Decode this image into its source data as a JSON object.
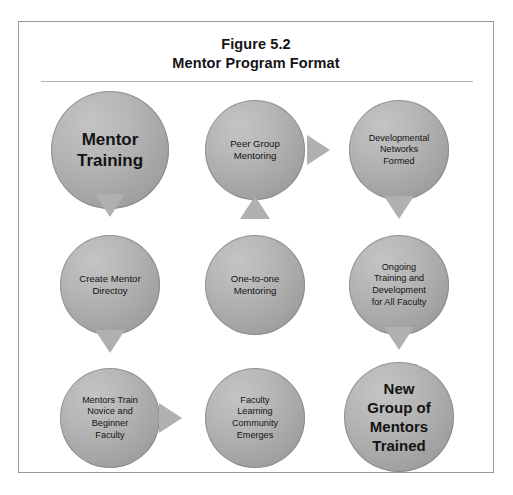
{
  "figure": {
    "title_line1": "Figure 5.2",
    "title_line2": "Mentor Program Format"
  },
  "colors": {
    "frame_border": "#9a9a9a",
    "title_rule": "#b4b4b4",
    "node_fill_light": "#c4c4c4",
    "node_fill_dark": "#969696",
    "arrow_fill": "#b0b0b0",
    "text": "#131313"
  },
  "nodes": [
    {
      "id": "mentor-training",
      "label": "Mentor\nTraining"
    },
    {
      "id": "peer-group-mentoring",
      "label": "Peer Group\nMentoring"
    },
    {
      "id": "developmental-networks-formed",
      "label": "Developmental\nNetworks\nFormed"
    },
    {
      "id": "create-mentor-directoy",
      "label": "Create Mentor\nDirectoy"
    },
    {
      "id": "one-to-one-mentoring",
      "label": "One-to-one\nMentoring"
    },
    {
      "id": "ongoing-training",
      "label": "Ongoing\nTraining and\nDevelopment\nfor All Faculty"
    },
    {
      "id": "mentors-train-novice",
      "label": "Mentors Train\nNovice and\nBeginner\nFaculty"
    },
    {
      "id": "faculty-learning-community",
      "label": "Faculty\nLearning\nCommunity\nEmerges"
    },
    {
      "id": "new-group-of-mentors-trained",
      "label": "New\nGroup of\nMentors\nTrained"
    }
  ],
  "arrows": [
    {
      "id": "arrow-mentor-training-to-create-directory",
      "direction": "down"
    },
    {
      "id": "arrow-one-to-one-to-peer-group",
      "direction": "up"
    },
    {
      "id": "arrow-peer-group-to-developmental-networks",
      "direction": "right"
    },
    {
      "id": "arrow-developmental-networks-to-ongoing",
      "direction": "down"
    },
    {
      "id": "arrow-create-directory-to-mentors-train",
      "direction": "down"
    },
    {
      "id": "arrow-ongoing-to-new-group",
      "direction": "down"
    },
    {
      "id": "arrow-mentors-train-to-faculty-learning",
      "direction": "right"
    }
  ]
}
